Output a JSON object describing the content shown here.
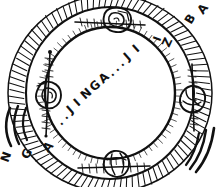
{
  "artwork": {
    "title": "JINGA ring device sketch",
    "medium": "hand-drawn ink line art",
    "background_color": "#ffffff",
    "ink_color": "#111111"
  },
  "inner_text": {
    "string": "..JINGA...JI",
    "characters": [
      ".",
      ".",
      "J",
      "I",
      "N",
      "G",
      "A",
      ".",
      ".",
      ".",
      "J",
      "I"
    ]
  },
  "outer_band_text": {
    "string": "NGA...JIZ..BA",
    "left_segment": [
      "N",
      "G",
      "A"
    ],
    "right_segment": [
      "Z",
      "I",
      "B",
      "A"
    ]
  },
  "bolts": [
    {
      "name": "bolt-top",
      "position": "top"
    },
    {
      "name": "bolt-right",
      "position": "right"
    },
    {
      "name": "bolt-bottom",
      "position": "bottom"
    },
    {
      "name": "bolt-left",
      "position": "left"
    }
  ],
  "motion_arcs": {
    "left_count": 3,
    "right_count": 3
  },
  "ring": {
    "hatch_marks": 96,
    "outer_radius": 101,
    "band_outer_radius": 86,
    "band_inner_radius": 66,
    "inner_radius": 64
  }
}
